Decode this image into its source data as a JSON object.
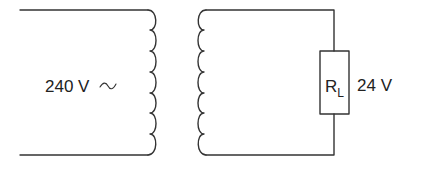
{
  "diagram": {
    "type": "circuit",
    "primary": {
      "label": "240 V",
      "ac_symbol": "~",
      "coil_turns": 7
    },
    "secondary": {
      "coil_turns": 7,
      "load": {
        "symbol": "R",
        "subscript": "L",
        "voltage_label": "24 V"
      }
    },
    "colors": {
      "line": "#333333",
      "text": "#222222",
      "background": "#ffffff"
    }
  }
}
